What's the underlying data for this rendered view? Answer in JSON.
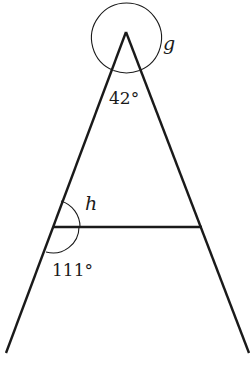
{
  "diagram": {
    "type": "geometry-angles",
    "labels": {
      "apex_angle": "42°",
      "reflex_angle": "g",
      "upper_angle": "h",
      "lower_angle": "111°"
    },
    "colors": {
      "stroke": "#1a1a1a",
      "background": "#ffffff"
    }
  }
}
